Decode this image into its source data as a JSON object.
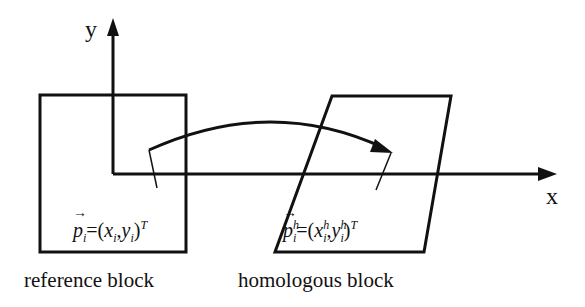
{
  "diagram": {
    "type": "coordinate-transform",
    "axes": {
      "x_label": "x",
      "y_label": "y"
    },
    "blocks": [
      {
        "id": "reference",
        "caption": "reference block",
        "shape": "square",
        "point_label": {
          "vec": "p",
          "sub": "i",
          "eq": "=(",
          "x": "x",
          "xsub": "i",
          "sep": ",",
          "y": "y",
          "ysub": "i",
          "close": ")",
          "sup": "T"
        }
      },
      {
        "id": "homologous",
        "caption": "homologous block",
        "shape": "parallelogram",
        "point_label": {
          "vec": "p",
          "supvec": "h",
          "sub": "i",
          "eq": "=(",
          "x": "x",
          "xsup": "h",
          "xsub": "i",
          "sep": ",",
          "y": "y",
          "ysup": "h",
          "ysub": "i",
          "close": ")",
          "sup": "T"
        }
      }
    ],
    "arrow": {
      "from": "reference",
      "to": "homologous",
      "style": "curved"
    },
    "colors": {
      "stroke": "#111111",
      "background": "#ffffff"
    }
  }
}
